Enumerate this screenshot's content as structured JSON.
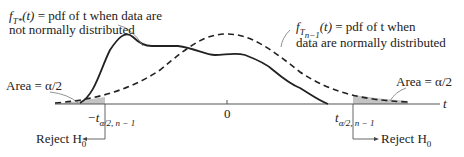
{
  "title": "",
  "labels": {
    "nonnormal": {
      "func": "f",
      "sub": "T*",
      "arg": "(t)",
      "line1_rest": " = pdf of t when data are",
      "line2": "not normally distributed"
    },
    "normal": {
      "func": "f",
      "sub": "T",
      "subsub": "n−1",
      "arg": "(t)",
      "line1_rest": " = pdf of t when",
      "line2": "data are normally distributed"
    },
    "area_left": "Area = α/2",
    "area_right": "Area = α/2",
    "axis_var": "t",
    "zero": "0",
    "crit_left": "−t",
    "crit_left_sub": "α/2, n − 1",
    "crit_right": "t",
    "crit_right_sub": "α/2, n − 1",
    "reject_left": "Reject H",
    "reject_left_sub": "0",
    "reject_right": "Reject H",
    "reject_right_sub": "0"
  },
  "colors": {
    "curve": "#222222",
    "shade": "#bdbdbd",
    "axis": "#444444"
  }
}
